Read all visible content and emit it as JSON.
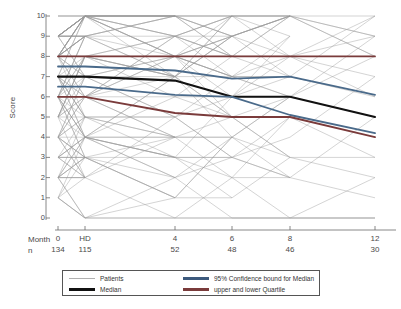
{
  "chart_data": {
    "type": "line",
    "title": "",
    "xlabel": "Month",
    "ylabel": "Score",
    "ylim": [
      0,
      10
    ],
    "xlim": [
      0,
      13
    ],
    "grid": false,
    "legend_position": "bottom",
    "y_ticks": [
      10,
      9,
      8,
      7,
      6,
      5,
      4,
      3,
      2,
      1,
      0
    ],
    "x_axis_rows": {
      "month_label": "Month",
      "n_label": "n",
      "months": [
        "0",
        "HD",
        "4",
        "6",
        "8",
        "12"
      ],
      "n": [
        "134",
        "115",
        "52",
        "48",
        "46",
        "30"
      ],
      "x_positions": [
        58,
        85,
        175,
        232,
        290,
        375
      ]
    },
    "series": [
      {
        "name": "Median",
        "color": "#111111",
        "width": 2.1,
        "values": [
          7.0,
          7.0,
          6.8,
          6.0,
          6.0,
          5.0
        ]
      },
      {
        "name": "95% Confidence bound for Median (upper)",
        "color": "#4a6a8a",
        "width": 1.8,
        "values": [
          7.5,
          7.5,
          7.3,
          6.9,
          7.0,
          6.1
        ]
      },
      {
        "name": "95% Confidence bound for Median (lower)",
        "color": "#4a6a8a",
        "width": 1.8,
        "values": [
          6.5,
          6.5,
          6.1,
          6.0,
          5.1,
          4.2
        ]
      },
      {
        "name": "upper Quartile",
        "color": "#7a3b3b",
        "width": 1.8,
        "values": [
          8.0,
          8.0,
          8.0,
          8.0,
          8.0,
          8.0
        ]
      },
      {
        "name": "lower Quartile",
        "color": "#7a3b3b",
        "width": 1.8,
        "values": [
          6.0,
          6.0,
          5.2,
          5.0,
          5.0,
          4.0
        ]
      }
    ],
    "patients": {
      "name": "Patients",
      "color": "#9a9a9a",
      "width": 0.5,
      "count": 134,
      "note": "Individual patient trajectories drawn as thin grey spaghetti lines"
    }
  },
  "legend": {
    "items": [
      {
        "label": "Patients",
        "color": "#b0b0b0",
        "thickness": "1px"
      },
      {
        "label": "Median",
        "color": "#111111",
        "thickness": "3px"
      },
      {
        "label": "95% Confidence bound for Median",
        "color": "#3d5a7d",
        "thickness": "3px"
      },
      {
        "label": "upper and lower Quartile",
        "color": "#7a3b3b",
        "thickness": "3px"
      }
    ]
  },
  "colors": {
    "axis": "#6b6b6b",
    "text": "#4a4a4a",
    "patient_line": "#9a9a9a",
    "median": "#111111",
    "confidence": "#4a6a8a",
    "quartile": "#7a3b3b",
    "background": "#ffffff"
  }
}
